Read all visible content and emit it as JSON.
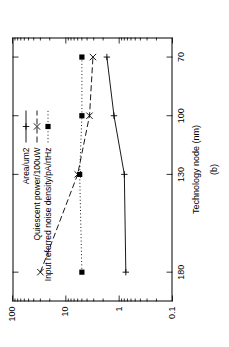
{
  "figure": {
    "caption": "(b)",
    "background": "#ffffff",
    "ink": "#000000"
  },
  "chart_data": {
    "type": "line",
    "title": "",
    "subtitle": "",
    "xlabel": "Technology node (nm)",
    "ylabel": "",
    "xscale": "linear-reversed",
    "yscale": "log",
    "ylim": [
      0.1,
      100
    ],
    "xlim": [
      195,
      60
    ],
    "grid": false,
    "legend_position": "top-left",
    "x_ticks": [
      180,
      130,
      100,
      70
    ],
    "x_tick_labels": [
      "180",
      "130",
      "100",
      "70"
    ],
    "y_ticks": [
      0.1,
      1,
      10,
      100
    ],
    "y_tick_labels": [
      "0.1",
      "1",
      "10",
      "100"
    ],
    "categories": [
      180,
      130,
      100,
      70
    ],
    "series": [
      {
        "name": "Area/um2",
        "line_style": "solid",
        "marker": "plus",
        "color": "#000000",
        "values": [
          0.75,
          0.8,
          1.25,
          1.7
        ]
      },
      {
        "name": "Quiescent power/100uW",
        "line_style": "dashed",
        "marker": "cross",
        "color": "#000000",
        "values": [
          30.0,
          6.0,
          3.6,
          3.1
        ]
      },
      {
        "name": "Input referred noise density/pA/rtHz",
        "line_style": "dotted",
        "marker": "filled-square",
        "color": "#000000",
        "values": [
          5.0,
          5.5,
          5.0,
          5.0
        ]
      }
    ],
    "annotations": []
  }
}
